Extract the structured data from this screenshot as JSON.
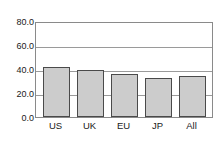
{
  "chart_data": {
    "type": "bar",
    "title": "",
    "subtitle": "",
    "xlabel": "",
    "ylabel": "",
    "categories": [
      "US",
      "UK",
      "EU",
      "JP",
      "All"
    ],
    "values": [
      41.5,
      39.0,
      36.0,
      32.5,
      34.0
    ],
    "series": [
      {
        "name": "",
        "values": [
          41.5,
          39.0,
          36.0,
          32.5,
          34.0
        ]
      }
    ],
    "ylim": [
      0.0,
      80.0
    ],
    "ytick_values": [
      0.0,
      20.0,
      40.0,
      60.0,
      80.0
    ],
    "ytick_labels": [
      "0.0",
      "20.0",
      "40.0",
      "60.0",
      "80.0"
    ],
    "grid": "horizontal",
    "legend": "none",
    "bar_fill_color": "#cccccc",
    "bar_border_color": "#4a4a4a",
    "axis_color": "#8a8a8a",
    "gridline_color": "#9a9a9a",
    "background_color": "#ffffff",
    "annotations": []
  }
}
